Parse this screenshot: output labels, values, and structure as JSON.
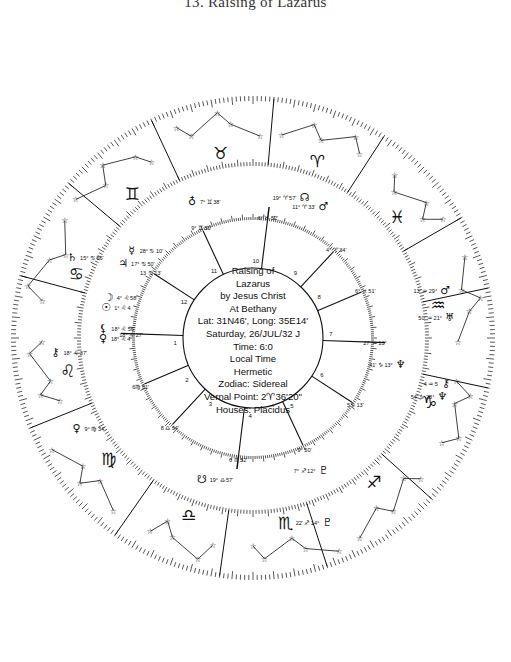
{
  "title": "13. Raising of Lazarus",
  "center_info": {
    "line1": "Raising   of",
    "line2": "Lazarus",
    "line3": "by Jesus Christ",
    "line4": "At Bethany",
    "line5": "Lat: 31N46', Long: 35E14'",
    "line6": "Saturday, 26/JUL/32  J",
    "line7": "Time:   6:0",
    "line8": "Local Time",
    "line9": "Hermetic",
    "line10": "Zodiac: Sidereal",
    "line11": "Vernal Point: 2♈︎36'20\"",
    "line12": "Houses: Placidus"
  },
  "chart": {
    "center": [
      253,
      338
    ],
    "radii": {
      "outer": 242,
      "zodiac_inner": 172,
      "planet_outer": 170,
      "planet_inner": 118,
      "house_circle": 70
    },
    "colors": {
      "ink": "#111111",
      "background": "#ffffff"
    },
    "zodiac_signs": [
      {
        "name": "Taurus",
        "glyph": "♉︎",
        "angle": 100
      },
      {
        "name": "Aries",
        "glyph": "♈︎",
        "angle": 70
      },
      {
        "name": "Pisces",
        "glyph": "♓︎",
        "angle": 40
      },
      {
        "name": "Aquarius",
        "glyph": "♒︎",
        "angle": 10
      },
      {
        "name": "Capricorn",
        "glyph": "♑︎",
        "angle": -20
      },
      {
        "name": "Sagittarius",
        "glyph": "♐︎",
        "angle": -50
      },
      {
        "name": "Scorpio",
        "glyph": "♏︎",
        "angle": -80
      },
      {
        "name": "Libra",
        "glyph": "♎︎",
        "angle": -110
      },
      {
        "name": "Virgo",
        "glyph": "♍︎",
        "angle": -140
      },
      {
        "name": "Leo",
        "glyph": "♌︎",
        "angle": -170
      },
      {
        "name": "Cancer",
        "glyph": "♋︎",
        "angle": 160
      },
      {
        "name": "Gemini",
        "glyph": "♊︎",
        "angle": 130
      }
    ],
    "house_numbers": [
      {
        "n": "1",
        "angle": 183
      },
      {
        "n": "2",
        "angle": 212
      },
      {
        "n": "3",
        "angle": 237
      },
      {
        "n": "4",
        "angle": 268
      },
      {
        "n": "5",
        "angle": 300
      },
      {
        "n": "6",
        "angle": 332
      },
      {
        "n": "7",
        "angle": 3
      },
      {
        "n": "8",
        "angle": 32
      },
      {
        "n": "9",
        "angle": 57
      },
      {
        "n": "10",
        "angle": 88
      },
      {
        "n": "11",
        "angle": 120
      },
      {
        "n": "12",
        "angle": 152
      }
    ],
    "house_cusps": [
      {
        "angle": 178,
        "label": "18° ♌︎ 27'"
      },
      {
        "angle": 203,
        "label": "6♍︎ 51'"
      },
      {
        "angle": 227,
        "label": "8 ♎︎ 34'"
      },
      {
        "angle": 263,
        "label": "6 ♏︎ 52'"
      },
      {
        "angle": 295,
        "label": "9° 50'"
      },
      {
        "angle": 327,
        "label": "5♑︎ 13'"
      },
      {
        "angle": 358,
        "label": "27' ♒︎ 13°"
      },
      {
        "angle": 23,
        "label": "6° ♓︎ 51'"
      },
      {
        "angle": 47,
        "label": "4° ♈︎ 34'"
      },
      {
        "angle": 83,
        "label": "6° ♉︎ 52'"
      },
      {
        "angle": 115,
        "label": "9° ♊︎ 50'"
      },
      {
        "angle": 147,
        "label": "13 ♋︎ 13'"
      }
    ],
    "planets": [
      {
        "glyph": "☊︎",
        "name": "North Node",
        "text": "19° ♈︎ 57'",
        "angle": 70,
        "r": 150
      },
      {
        "glyph": "♂︎",
        "name": "Mars",
        "text": "11° ♈︎ 33'",
        "angle": 62,
        "r": 150
      },
      {
        "glyph": "♂︎",
        "name": "Mars-outer",
        "text": "13' ♒︎ 29°",
        "angle": 14,
        "r": 198
      },
      {
        "glyph": "♅︎",
        "name": "Uranus",
        "text": "50' ♒︎ 21°",
        "angle": 6,
        "r": 198
      },
      {
        "glyph": "♆︎",
        "name": "Neptune",
        "text": "41' ♑︎ 13°",
        "angle": -10,
        "r": 150
      },
      {
        "glyph": "⚷︎",
        "name": "Chiron",
        "text": "4 ♒︎ 5",
        "angle": -13,
        "r": 198
      },
      {
        "glyph": "♆︎",
        "name": "Neptune-outer",
        "text": "54' ♑︎ 28°",
        "angle": -17,
        "r": 198
      },
      {
        "glyph": "♇︎",
        "name": "Pluto",
        "text": "7° ♐︎ 12°",
        "angle": -62,
        "r": 150
      },
      {
        "glyph": "♇︎",
        "name": "Pluto-outer",
        "text": "22' ♐︎ 14°",
        "angle": -68,
        "r": 198
      },
      {
        "glyph": "☋︎",
        "name": "South Node",
        "text": "19° ♎︎ 57'",
        "angle": -110,
        "r": 150
      },
      {
        "glyph": "♀︎",
        "name": "Venus",
        "text": "9° ♍︎ 34'",
        "angle": -153,
        "r": 198
      },
      {
        "glyph": "☉︎",
        "name": "Sun",
        "text": "1° ♌︎ 4",
        "angle": 168,
        "r": 150
      },
      {
        "glyph": "☽︎",
        "name": "Moon",
        "text": "4° ♌︎ 58'",
        "angle": 164,
        "r": 150
      },
      {
        "glyph": "♃︎",
        "name": "Jupiter",
        "text": "17° ♋︎ 50'",
        "angle": 150,
        "r": 150
      },
      {
        "glyph": "☿︎",
        "name": "Mercury",
        "text": "28° ♋︎ 10'",
        "angle": 144,
        "r": 150
      },
      {
        "glyph": "♄︎",
        "name": "Saturn",
        "text": "15° ♋︎ 56'",
        "angle": 156,
        "r": 198
      },
      {
        "glyph": "♀︎",
        "name": "Venus-leo",
        "text": "18° ♌︎ 4",
        "angle": 180,
        "r": 150
      },
      {
        "glyph": "⚸︎",
        "name": "Lilith",
        "text": "18° ♌︎ 56'",
        "angle": 176,
        "r": 150
      },
      {
        "glyph": "⚷︎",
        "name": "Chiron-leo",
        "text": "18° ♌︎ 37'",
        "angle": -176,
        "r": 198
      },
      {
        "glyph": "♁︎",
        "name": "Earth-gemini",
        "text": "7° ♊︎ 38'",
        "angle": 114,
        "r": 150
      }
    ],
    "axis_lines": [
      {
        "angle": 178
      },
      {
        "angle": 358
      },
      {
        "angle": 83
      },
      {
        "angle": 263
      }
    ],
    "constellation_dividers": [
      85,
      115,
      57,
      30,
      12,
      -12,
      -42,
      -72,
      -98,
      -125,
      -158,
      165,
      140
    ]
  }
}
